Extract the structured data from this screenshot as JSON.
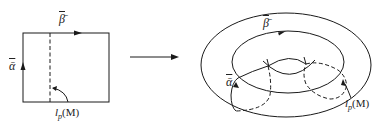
{
  "diagram": {
    "type": "square-to-torus identification",
    "left": {
      "shape": "square",
      "labels": {
        "top_edge": "β̄",
        "left_edge": "ᾱ",
        "curve_base": "l",
        "curve_sub": "p",
        "curve_arg": "(M)"
      }
    },
    "arrow": {
      "direction": "right"
    },
    "right": {
      "shape": "torus",
      "labels": {
        "longitude": "β̄",
        "meridian": "ᾱ",
        "curve_base": "l",
        "curve_sub": "p",
        "curve_arg": "(M)"
      }
    },
    "colors": {
      "stroke": "#1a1a1a",
      "background": "#ffffff"
    }
  }
}
